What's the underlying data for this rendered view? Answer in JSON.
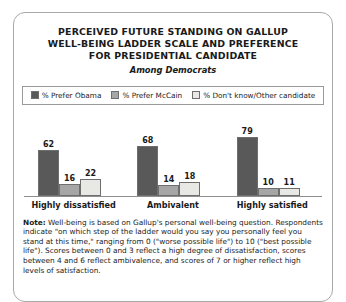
{
  "card": {
    "title_lines": [
      "PERCEIVED FUTURE STANDING ON GALLUP",
      "WELL-BEING LADDER SCALE AND PREFERENCE",
      "FOR PRESIDENTIAL CANDIDATE"
    ],
    "subtitle": "Among Democrats"
  },
  "note": {
    "label": "Note:",
    "text": " Well-being is based on Gallup's personal well-being question. Respondents indicate \"on which step of the ladder would you say you personally feel you stand at this time,\" ranging from 0 (\"worse possible life\") to 10 (\"best possible life\"). Scores between 0 and 3 reflect a high degree of dissatisfaction, scores between 4 and 6 reflect ambivalence, and scores of 7 or higher reflect high levels of satisfaction."
  },
  "colors": {
    "obama": "#595959",
    "mccain": "#a6a6a6",
    "dontknow": "#e8e8e4",
    "bar_border": "#6e6e6e",
    "card_border": "#a8a8a8",
    "axis": "#8f8f8f",
    "text": "#1a1a1a"
  },
  "chart_data": {
    "type": "bar",
    "title": "PERCEIVED FUTURE STANDING ON GALLUP WELL-BEING LADDER SCALE AND PREFERENCE FOR PRESIDENTIAL CANDIDATE",
    "subtitle": "Among Democrats",
    "xlabel": "",
    "ylabel": "",
    "ylim": [
      0,
      100
    ],
    "grid": false,
    "legend_position": "top",
    "categories": [
      "Highly dissatisfied",
      "Ambivalent",
      "Highly satisfied"
    ],
    "series": [
      {
        "name": "% Prefer Obama",
        "color": "#595959",
        "values": [
          62,
          68,
          79
        ]
      },
      {
        "name": "% Prefer McCain",
        "color": "#a6a6a6",
        "values": [
          16,
          14,
          10
        ]
      },
      {
        "name": "% Don't know/Other candidate",
        "color": "#e8e8e4",
        "values": [
          22,
          18,
          11
        ]
      }
    ]
  }
}
